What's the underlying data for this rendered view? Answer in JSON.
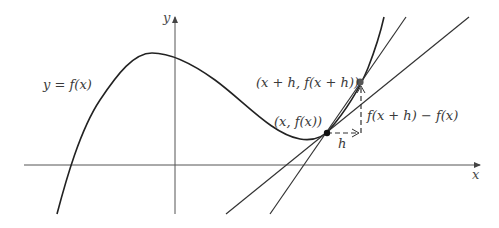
{
  "diagram": {
    "axes": {
      "x_label": "x",
      "y_label": "y"
    },
    "labels": {
      "curve": "y = f(x)",
      "point_a": "(x, f(x))",
      "point_b": "(x + h, f(x + h))",
      "delta_x": "h",
      "delta_y": "f(x + h) − f(x)"
    },
    "elements": {
      "curve": "cubic function y = f(x)",
      "secant_line": "line through (x, f(x)) and (x + h, f(x + h))",
      "tangent_line": "tangent line at (x, f(x))",
      "horizontal_increment": "dashed arrow of length h",
      "vertical_increment": "dashed arrow of length f(x + h) − f(x)"
    },
    "colors": {
      "stroke": "#222222",
      "axis": "#555555",
      "text": "#3a3a3a",
      "background": "#ffffff"
    }
  }
}
